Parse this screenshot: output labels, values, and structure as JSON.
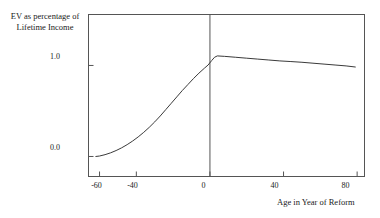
{
  "chart_data": {
    "type": "line",
    "title": "",
    "xlabel": "Age in Year of Reform",
    "ylabel": "EV as percentage of\nLifetime Income",
    "ylabel_line1": "EV as percentage of",
    "ylabel_line2": "Lifetime Income",
    "xlim": [
      -66,
      84
    ],
    "ylim": [
      -0.22,
      1.56
    ],
    "xticks": [
      -60,
      -40,
      0,
      40,
      80
    ],
    "xticklabels": [
      "-60",
      "-40",
      "0",
      "40",
      "80"
    ],
    "yticks": [
      0.0,
      1.0
    ],
    "yticklabels": [
      "0.0",
      "1.0"
    ],
    "grid": false,
    "legend": null,
    "frame": "box",
    "line_color": "#3a3a3a",
    "annotations": [
      {
        "name": "reform-year-vertical-line",
        "type": "vline",
        "x": 0
      }
    ],
    "series": [
      {
        "name": "EV as percentage of Lifetime Income",
        "x": [
          -62,
          -60,
          -57,
          -54,
          -51,
          -48,
          -45,
          -42,
          -39,
          -36,
          -33,
          -30,
          -27,
          -24,
          -21,
          -18,
          -15,
          -12,
          -9,
          -6,
          -3,
          -1,
          1,
          2.5,
          4,
          8,
          14,
          20,
          26,
          32,
          38,
          44,
          50,
          56,
          62,
          68,
          74,
          79
        ],
        "y": [
          0.0,
          0.005,
          0.02,
          0.04,
          0.065,
          0.095,
          0.13,
          0.17,
          0.215,
          0.265,
          0.32,
          0.38,
          0.445,
          0.515,
          0.585,
          0.655,
          0.725,
          0.79,
          0.855,
          0.915,
          0.97,
          1.005,
          1.055,
          1.09,
          1.105,
          1.1,
          1.09,
          1.08,
          1.07,
          1.06,
          1.05,
          1.043,
          1.035,
          1.025,
          1.015,
          1.005,
          0.995,
          0.983
        ]
      }
    ]
  },
  "axes": {
    "ylabel_line1": "EV as percentage of",
    "ylabel_line2": "Lifetime Income",
    "xlabel": "Age in Year of Reform",
    "ytick_0": "0.0",
    "ytick_1": "1.0",
    "xtick_m60": "-60",
    "xtick_m40": "-40",
    "xtick_0": "0",
    "xtick_40": "40",
    "xtick_80": "80"
  }
}
